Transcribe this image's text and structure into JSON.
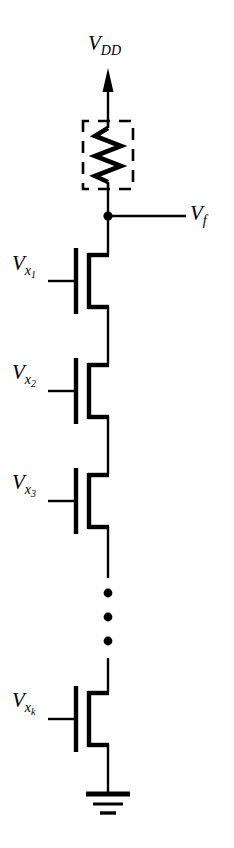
{
  "figure": {
    "type": "circuit-schematic",
    "background_color": "#fefefe",
    "line_color": "#000000"
  },
  "labels": {
    "supply": {
      "base": "V",
      "sub": "DD",
      "text": "V_DD"
    },
    "output": {
      "base": "V",
      "sub": "f",
      "text": "V_f"
    },
    "gate1": {
      "base": "V",
      "sub": "x",
      "sub2": "1",
      "text": "V_x1"
    },
    "gate2": {
      "base": "V",
      "sub": "x",
      "sub2": "2",
      "text": "V_x2"
    },
    "gate3": {
      "base": "V",
      "sub": "x",
      "sub2": "3",
      "text": "V_x3"
    },
    "gatek": {
      "base": "V",
      "sub": "x",
      "sub2": "k",
      "text": "V_xk"
    }
  },
  "components": {
    "supply_arrow": "up-arrow-icon",
    "pullup_resistor": "resistor-zigzag-icon",
    "resistor_highlight_box": "dashed-rectangle",
    "output_node": "junction-dot",
    "transistors": [
      {
        "name": "transistor-1",
        "gate_label": "V_x1",
        "type": "nmos"
      },
      {
        "name": "transistor-2",
        "gate_label": "V_x2",
        "type": "nmos"
      },
      {
        "name": "transistor-3",
        "gate_label": "V_x3",
        "type": "nmos"
      },
      {
        "name": "transistor-k",
        "gate_label": "V_xk",
        "type": "nmos"
      }
    ],
    "ellipsis": {
      "name": "vertical-ellipsis",
      "dots": 3
    },
    "ground": {
      "name": "ground-icon",
      "bars": 3
    }
  }
}
